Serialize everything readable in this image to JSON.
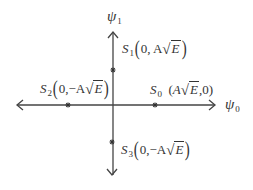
{
  "diagram": {
    "type": "signal-constellation",
    "background": "#ffffff",
    "line_color": "#333333",
    "axes": {
      "horizontal": {
        "label_symbol": "ψ",
        "label_subscript": "0",
        "from": [
          17,
          105
        ],
        "to": [
          215,
          105
        ],
        "arrows": "both"
      },
      "vertical": {
        "label_symbol": "ψ",
        "label_subscript": "1",
        "from": [
          113,
          32
        ],
        "to": [
          113,
          175
        ],
        "arrows": "both"
      }
    },
    "points": [
      {
        "name": "S",
        "subscript": "0",
        "coord_text": "(A√E, 0)",
        "open": "(",
        "first": "A",
        "radicand": "E",
        "sep": ",0",
        "close": ")",
        "marker": [
          155,
          105
        ]
      },
      {
        "name": "S",
        "subscript": "1",
        "coord_text": "(0, A√E)",
        "open": "(",
        "prefix": "0, A",
        "radicand": "E",
        "close": ")",
        "marker": [
          113,
          70
        ]
      },
      {
        "name": "S",
        "subscript": "2",
        "coord_text": "(0,−A√E)",
        "open": "(",
        "prefix": "0,−A",
        "radicand": "E",
        "close": ")",
        "marker": [
          68,
          105
        ]
      },
      {
        "name": "S",
        "subscript": "3",
        "coord_text": "(0,−A√E)",
        "open": "(",
        "prefix": "0,−A",
        "radicand": "E",
        "close": ")",
        "marker": [
          112,
          142
        ]
      }
    ],
    "sqrt_symbol": "√"
  }
}
